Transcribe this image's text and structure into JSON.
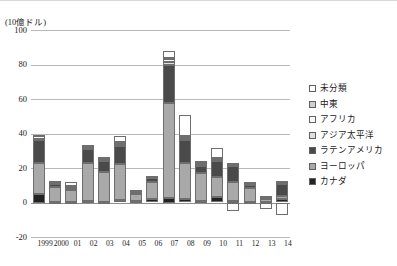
{
  "axis": {
    "unit_label": "(10億ドル)",
    "y_ticks": [
      100,
      80,
      60,
      40,
      20,
      0,
      -20
    ],
    "y_min": -20,
    "y_max": 100
  },
  "legend": {
    "items": [
      {
        "label": "未分類",
        "color": "#ffffff"
      },
      {
        "label": "中東",
        "color": "#cfcfcf"
      },
      {
        "label": "アフリカ",
        "color": "#fafafa"
      },
      {
        "label": "アジア太平洋",
        "color": "#e0e0e0"
      },
      {
        "label": "ラテンアメリカ",
        "color": "#4a4a4a"
      },
      {
        "label": "ヨーロッパ",
        "color": "#a9a9a9"
      },
      {
        "label": "カナダ",
        "color": "#232323"
      }
    ]
  },
  "chart_data": {
    "type": "bar",
    "stacked": true,
    "title": "",
    "xlabel": "",
    "ylabel": "(10億ドル)",
    "ylim": [
      -20,
      100
    ],
    "grid": true,
    "legend_position": "right",
    "categories": [
      "1999",
      "2000",
      "01",
      "02",
      "03",
      "04",
      "05",
      "06",
      "07",
      "08",
      "09",
      "10",
      "11",
      "12",
      "13",
      "14"
    ],
    "series": [
      {
        "name": "カナダ",
        "color": "#232323",
        "values": [
          5.0,
          0.5,
          0.5,
          1.0,
          0.5,
          1.5,
          1.0,
          2.0,
          2.5,
          2.0,
          1.0,
          3.0,
          1.0,
          0.5,
          0.5,
          2.0
        ]
      },
      {
        "name": "ヨーロッパ",
        "color": "#a9a9a9",
        "values": [
          18.0,
          8.5,
          6.5,
          22.0,
          17.0,
          21.0,
          4.0,
          10.0,
          55.0,
          21.0,
          16.0,
          12.0,
          11.0,
          8.0,
          1.5,
          1.5
        ]
      },
      {
        "name": "ラテンアメリカ",
        "color": "#4a4a4a",
        "values": [
          13.0,
          2.0,
          1.0,
          8.0,
          6.5,
          10.0,
          0.5,
          2.0,
          22.0,
          13.0,
          4.0,
          9.0,
          9.0,
          2.0,
          0.5,
          7.5
        ]
      },
      {
        "name": "アジア太平洋",
        "color": "#e0e0e0",
        "values": [
          1.0,
          0.5,
          0.5,
          1.0,
          1.0,
          1.0,
          0.5,
          0.5,
          2.0,
          1.0,
          1.0,
          1.0,
          1.0,
          0.5,
          0.5,
          0.5
        ]
      },
      {
        "name": "アフリカ",
        "color": "#fafafa",
        "values": [
          1.5,
          0.5,
          0.5,
          1.0,
          0.5,
          1.0,
          0.5,
          0.5,
          1.5,
          1.0,
          0.5,
          0.5,
          0.5,
          0.5,
          0.5,
          0.5
        ]
      },
      {
        "name": "中東",
        "color": "#cfcfcf",
        "values": [
          0.5,
          0.5,
          0.5,
          0.5,
          0.5,
          0.5,
          0.5,
          0.5,
          1.0,
          0.5,
          0.5,
          0.5,
          0.5,
          0.5,
          0.5,
          0.5
        ]
      },
      {
        "name": "未分類",
        "color": "#ffffff",
        "values": [
          0.0,
          0.0,
          2.5,
          0.0,
          0.5,
          3.5,
          0.5,
          0.0,
          4.0,
          12.0,
          1.0,
          5.5,
          0.0,
          0.0,
          0.0,
          0.0
        ]
      }
    ],
    "negative_segments": [
      {
        "category": "11",
        "name": "未分類",
        "color": "#ffffff",
        "value": -5.0
      },
      {
        "category": "13",
        "name": "未分類",
        "color": "#ffffff",
        "value": -4.0
      },
      {
        "category": "14",
        "name": "未分類",
        "color": "#ffffff",
        "value": -7.0
      }
    ],
    "totals": [
      39.0,
      12.5,
      12.0,
      33.5,
      26.5,
      38.5,
      7.5,
      15.5,
      88.0,
      50.5,
      24.0,
      31.5,
      23.0,
      12.0,
      4.0,
      12.5
    ]
  }
}
